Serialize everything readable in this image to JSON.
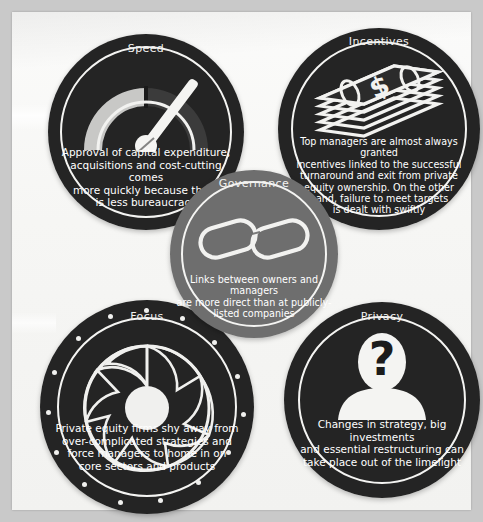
{
  "background": {
    "page_color": "#c9c9c9",
    "paper_color": "#f6f6f4"
  },
  "colors": {
    "dark_ring": "#242424",
    "gray_ring": "#6e6e6e",
    "text": "#ffffff",
    "accent_light": "#f2f2f0"
  },
  "badges": [
    {
      "id": "speed",
      "label": "Speed",
      "icon": "speedometer-icon",
      "ring_color": "#242424",
      "text": "Approval of capital expenditure, acquisitions and cost-cutting comes more quickly because there is less bureaucracy",
      "lines": [
        "Approval of capital expenditure,",
        "acquisitions and cost-cutting comes",
        "more quickly because there",
        "is less bureaucracy"
      ]
    },
    {
      "id": "incentives",
      "label": "Incentives",
      "icon": "money-stack-icon",
      "ring_color": "#242424",
      "text": "Top managers are almost always granted incentives linked to the successful turnaround and exit from private equity ownership. On the other hand, failure to meet targets is dealt with swiftly",
      "lines": [
        "Top managers are almost always granted",
        "incentives linked to the successful",
        "turnaround and exit from private",
        "equity ownership. On the other",
        "hand, failure to meet targets",
        "is dealt with swiftly"
      ]
    },
    {
      "id": "governance",
      "label": "Governance",
      "icon": "chain-link-icon",
      "ring_color": "#6e6e6e",
      "text": "Links between owners and managers are more direct than at publicly-listed companies",
      "lines": [
        "Links between owners and managers",
        "are more direct than at publicly-",
        "listed companies"
      ]
    },
    {
      "id": "focus",
      "label": "Focus",
      "icon": "camera-aperture-icon",
      "ring_color": "#242424",
      "text": "Private equity firms shy away from over-complicated strategies and force managers to home in on core sectors and products",
      "lines": [
        "Private equity firms shy away from",
        "over-complicated strategies and",
        "force managers to home in on",
        "core sectors and products"
      ]
    },
    {
      "id": "privacy",
      "label": "Privacy",
      "icon": "anonymous-person-question-icon",
      "ring_color": "#242424",
      "text": "Changes in strategy, big investments and essential restructuring can take place out of the limelight",
      "lines": [
        "Changes in strategy, big investments",
        "and essential restructuring can",
        "take place out of the limelight"
      ]
    }
  ]
}
